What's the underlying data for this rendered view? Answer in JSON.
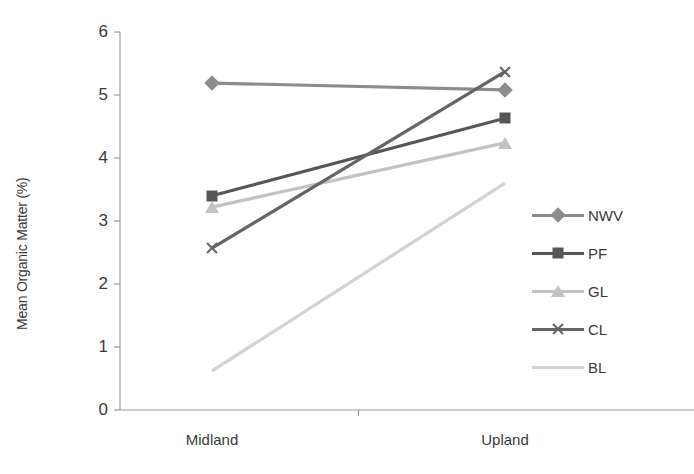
{
  "chart_data": {
    "type": "line",
    "title": "",
    "xlabel": "",
    "ylabel": "Mean Organic Matter (%)",
    "categories": [
      "Midland",
      "Upland"
    ],
    "ylim": [
      0,
      6
    ],
    "yticks": [
      "0",
      "1",
      "2",
      "3",
      "4",
      "5",
      "6"
    ],
    "grid": false,
    "legend_position": "right",
    "series": [
      {
        "name": "NWV",
        "values": [
          5.19,
          5.08
        ],
        "marker": "diamond",
        "color": "#8c8c8c"
      },
      {
        "name": "PF",
        "values": [
          3.4,
          4.63
        ],
        "marker": "square",
        "color": "#565656"
      },
      {
        "name": "GL",
        "values": [
          3.22,
          4.24
        ],
        "marker": "triangle",
        "color": "#c2c2c2"
      },
      {
        "name": "CL",
        "values": [
          2.57,
          5.37
        ],
        "marker": "x",
        "color": "#646464"
      },
      {
        "name": "BL",
        "values": [
          0.62,
          3.6
        ],
        "marker": "none",
        "color": "#d2d2d2"
      }
    ]
  },
  "axis": {
    "axis_color": "#9a9a9a"
  }
}
